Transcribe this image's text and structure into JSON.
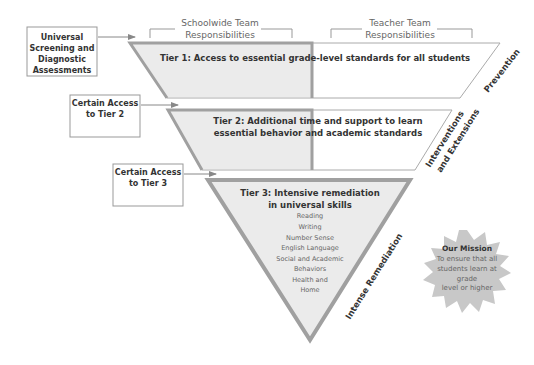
{
  "diagram": {
    "column_headers": {
      "schoolwide": [
        "Schoolwide Team",
        "Responsibilities"
      ],
      "teacher": [
        "Teacher Team",
        "Responsibilities"
      ]
    },
    "side_boxes": {
      "universal_screening": [
        "Universal",
        "Screening and",
        "Diagnostic",
        "Assessments"
      ],
      "access_tier2": [
        "Certain Access",
        "to Tier 2"
      ],
      "access_tier3": [
        "Certain Access",
        "to Tier 3"
      ]
    },
    "tiers": {
      "tier1": {
        "title": "Tier 1: Access to essential grade-level standards for all students",
        "side_label": "Prevention"
      },
      "tier2": {
        "title": [
          "Tier 2: Additional time and support to learn",
          "essential behavior and academic standards"
        ],
        "side_label": [
          "Interventions",
          "and Extensions"
        ]
      },
      "tier3": {
        "title": [
          "Tier 3: Intensive remediation",
          "in universal skills"
        ],
        "skills": [
          "Reading",
          "Writing",
          "Number Sense",
          "English Language",
          "Social and Academic",
          "Behaviors",
          "Health and",
          "Home"
        ],
        "side_label": "Intense Remediation"
      }
    },
    "mission": {
      "title": "Our Mission",
      "lines": [
        "To ensure that all",
        "students learn at",
        "grade",
        "level or higher"
      ]
    },
    "colors": {
      "shaded_fill": "#ebebeb",
      "border_gray": "#a0a0a0",
      "starburst": "#c8c8c8",
      "text_dark": "#333333",
      "text_light": "#666666"
    }
  }
}
